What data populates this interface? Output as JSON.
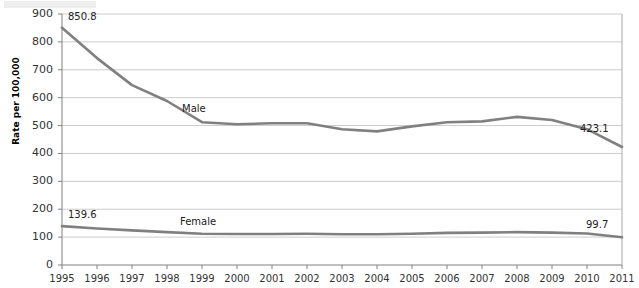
{
  "chart_data": {
    "type": "line",
    "title": "",
    "xlabel": "",
    "ylabel": "Rate per 100,000",
    "ylim": [
      0,
      900
    ],
    "ytick_step": 100,
    "yticks": [
      0,
      100,
      200,
      300,
      400,
      500,
      600,
      700,
      800,
      900
    ],
    "grid": true,
    "legend_position": "inline-on-series",
    "categories": [
      "1995",
      "1996",
      "1997",
      "1998",
      "1999",
      "2000",
      "2001",
      "2002",
      "2003",
      "2004",
      "2005",
      "2006",
      "2007",
      "2008",
      "2009",
      "2010",
      "2011"
    ],
    "series": [
      {
        "name": "Male",
        "color": "#808080",
        "values": [
          850.8,
          742.0,
          645.0,
          588.0,
          512.0,
          505.0,
          508.0,
          508.0,
          487.0,
          479.0,
          497.0,
          512.0,
          515.0,
          531.0,
          520.0,
          487.0,
          423.1
        ],
        "label_start": "850.8",
        "label_end": "423.1"
      },
      {
        "name": "Female",
        "color": "#808080",
        "values": [
          139.6,
          131.0,
          124.0,
          118.0,
          112.0,
          111.0,
          111.0,
          112.0,
          110.0,
          110.0,
          112.0,
          115.0,
          116.0,
          118.0,
          116.0,
          113.0,
          99.7
        ],
        "label_start": "139.6",
        "label_end": "99.7"
      }
    ],
    "annotations": [
      {
        "text": "Male",
        "series": "Male"
      },
      {
        "text": "Female",
        "series": "Female"
      },
      {
        "text": "850.8",
        "series": "Male",
        "at": "1995"
      },
      {
        "text": "423.1",
        "series": "Male",
        "at": "2011"
      },
      {
        "text": "139.6",
        "series": "Female",
        "at": "1995"
      },
      {
        "text": "99.7",
        "series": "Female",
        "at": "2011"
      }
    ],
    "colors": {
      "line": "#808080",
      "grid": "#cccccc",
      "axis": "#808080",
      "text": "#333333"
    }
  }
}
